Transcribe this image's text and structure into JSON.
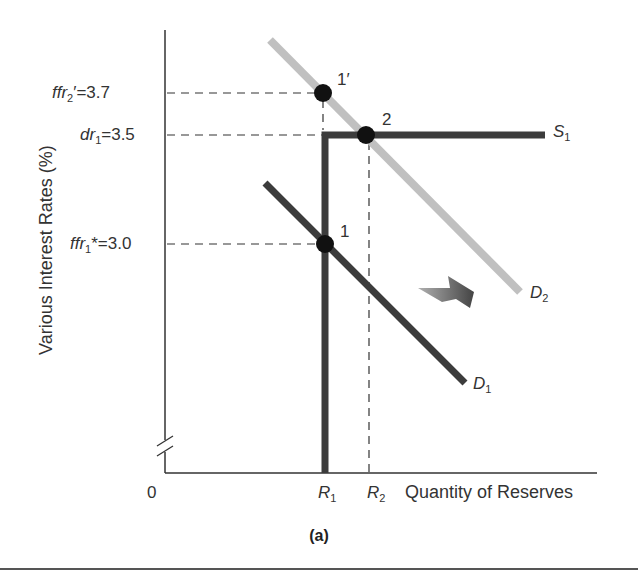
{
  "figure": {
    "caption": "(a)",
    "y_axis_label": "Various Interest Rates (%)",
    "x_axis_label": "Quantity of Reserves",
    "origin_label": "0",
    "y_ticks": [
      {
        "var": "ffr",
        "sub": "2",
        "suffix": "′",
        "text": "=3.7",
        "value": 3.7
      },
      {
        "var": "dr",
        "sub": "1",
        "suffix": "",
        "text": "=3.5",
        "value": 3.5
      },
      {
        "var": "ffr",
        "sub": "1",
        "suffix": "*",
        "text": "=3.0",
        "value": 3.0
      }
    ],
    "x_ticks": [
      {
        "var": "R",
        "sub": "1"
      },
      {
        "var": "R",
        "sub": "2"
      }
    ],
    "curves": {
      "S1": {
        "var": "S",
        "sub": "1",
        "color": "#3a3a3a"
      },
      "D1": {
        "var": "D",
        "sub": "1",
        "color": "#3a3a3a"
      },
      "D2": {
        "var": "D",
        "sub": "2",
        "color": "#bdbdbd"
      }
    },
    "points": [
      {
        "label": "1′",
        "rate": 3.7,
        "reserves": "R1"
      },
      {
        "label": "2",
        "rate": 3.5,
        "reserves": "R2"
      },
      {
        "label": "1",
        "rate": 3.0,
        "reserves": "R1"
      }
    ],
    "shift_arrow": "demand-shift-right"
  }
}
